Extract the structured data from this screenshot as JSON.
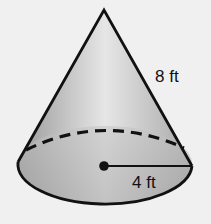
{
  "figure": {
    "shape": "cone",
    "slant_height_label": "8 ft",
    "radius_label": "4 ft",
    "colors": {
      "background": "#f0f0f0",
      "outline": "#111111",
      "shade_light": "#e6e6e6",
      "shade_dark": "#9a9a9a"
    }
  }
}
